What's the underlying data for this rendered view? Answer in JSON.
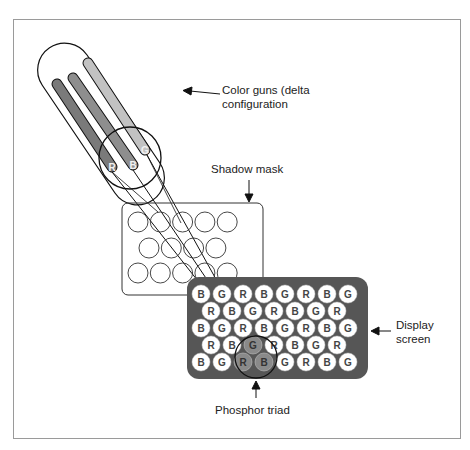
{
  "diagram": {
    "labels": {
      "color_guns": [
        "Color guns (delta",
        "configuration"
      ],
      "shadow_mask": "Shadow mask",
      "display_screen": [
        "Display",
        "screen"
      ],
      "phosphor_triad": "Phosphor triad"
    },
    "guns": [
      {
        "letter": "R",
        "fill": "#7a7a7a"
      },
      {
        "letter": "B",
        "fill": "#8e8e8e"
      },
      {
        "letter": "G",
        "fill": "#c2c2c2"
      }
    ],
    "shadow_mask_rows": [
      5,
      4,
      5
    ],
    "screen": {
      "fill": "#565656",
      "rows": [
        [
          "B",
          "G",
          "R",
          "B",
          "G",
          "R",
          "B",
          "G"
        ],
        [
          "R",
          "B",
          "G",
          "R",
          "B",
          "G",
          "R"
        ],
        [
          "B",
          "G",
          "R",
          "B",
          "G",
          "R",
          "B",
          "G"
        ],
        [
          "R",
          "B",
          "G",
          "R",
          "B",
          "G",
          "R"
        ],
        [
          "B",
          "G",
          "R",
          "B",
          "G",
          "R",
          "B",
          "G"
        ]
      ],
      "highlighted_triad": [
        [
          3,
          2
        ],
        [
          4,
          2
        ],
        [
          4,
          3
        ]
      ],
      "highlight_fill": "#8a8a8a"
    }
  }
}
